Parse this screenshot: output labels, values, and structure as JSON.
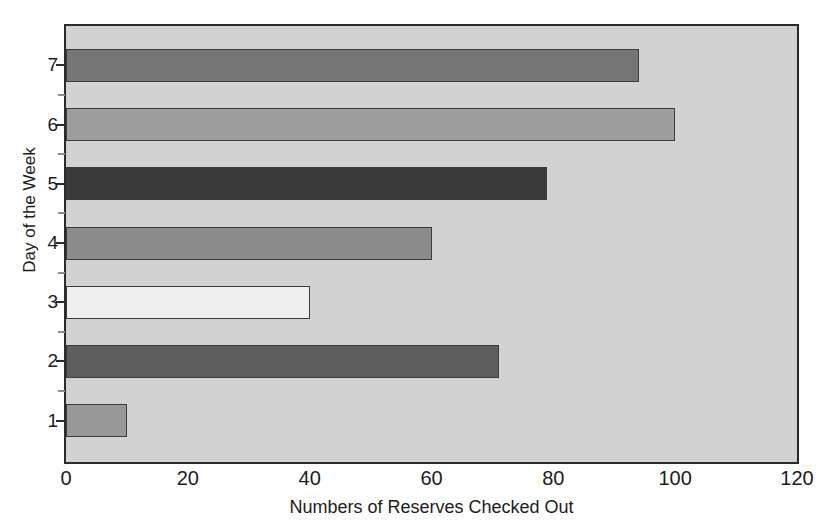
{
  "chart_data": {
    "type": "bar",
    "orientation": "horizontal",
    "title": "",
    "xlabel": "Numbers of Reserves Checked Out",
    "ylabel": "Day of the Week",
    "categories": [
      "1",
      "2",
      "3",
      "4",
      "5",
      "6",
      "7"
    ],
    "values": [
      10,
      71,
      40,
      60,
      79,
      100,
      94
    ],
    "xlim": [
      0,
      120
    ],
    "xticks": [
      0,
      20,
      40,
      60,
      80,
      100,
      120
    ],
    "xtick_labels": [
      "0",
      "20",
      "40",
      "60",
      "80",
      "100",
      "120"
    ],
    "yticks": [
      1,
      2,
      3,
      4,
      5,
      6,
      7
    ],
    "ytick_labels": [
      "1",
      "2",
      "3",
      "4",
      "5",
      "6",
      "7"
    ],
    "ylim": [
      0.3,
      7.7
    ],
    "grid": false,
    "legend": null,
    "plot_background": "#d2d2d2",
    "figure_background": "#ffffff",
    "axis_color": "#2b2b2b",
    "bars": [
      {
        "category": "1",
        "value": 10,
        "color": "#989898"
      },
      {
        "category": "2",
        "value": 71,
        "color": "#5e5e5e"
      },
      {
        "category": "3",
        "value": 40,
        "color": "#eeeeee"
      },
      {
        "category": "4",
        "value": 60,
        "color": "#8c8c8c"
      },
      {
        "category": "5",
        "value": 79,
        "color": "#3a3a3a"
      },
      {
        "category": "6",
        "value": 100,
        "color": "#9d9d9d"
      },
      {
        "category": "7",
        "value": 94,
        "color": "#767676"
      }
    ]
  }
}
